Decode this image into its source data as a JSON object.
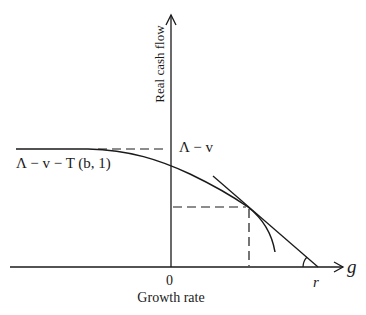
{
  "diagram": {
    "y_axis_label": "Real cash flow",
    "x_axis_label": "Growth rate",
    "x_axis_symbol": "g",
    "origin_label": "0",
    "intercept_label": "r",
    "upper_level_label": "Λ − v",
    "plateau_label": "Λ − v − T (b, 1)"
  },
  "colors": {
    "line": "#1a1a1a",
    "background": "#ffffff"
  }
}
